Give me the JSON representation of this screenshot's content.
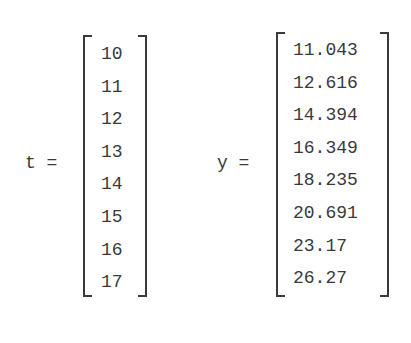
{
  "t_vector": {
    "label": "t =",
    "values": [
      "10",
      "11",
      "12",
      "13",
      "14",
      "15",
      "16",
      "17"
    ]
  },
  "y_vector": {
    "label": "y =",
    "values": [
      "11.043",
      "12.616",
      "14.394",
      "16.349",
      "18.235",
      "20.691",
      "23.17",
      "26.27"
    ]
  }
}
